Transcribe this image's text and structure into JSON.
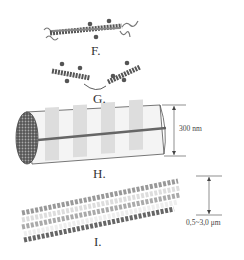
{
  "figure": {
    "panels": [
      {
        "id": "F",
        "label": "F.",
        "description": "collagen triple helix molecule"
      },
      {
        "id": "G",
        "label": "G.",
        "description": "staggered collagen molecules"
      },
      {
        "id": "H",
        "label": "H.",
        "description": "collagen fibril",
        "dimension": "300 nm"
      },
      {
        "id": "I",
        "label": "I.",
        "description": "collagen fiber bundle",
        "dimension": "0,5~3,0 μm"
      }
    ]
  }
}
